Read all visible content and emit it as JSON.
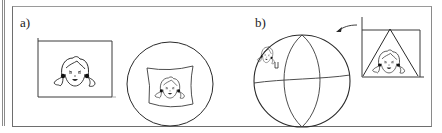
{
  "figure": {
    "panels": [
      {
        "label": "a)",
        "description": "Flat image of a girl's face in a rectangle, and the same image warped onto a circle"
      },
      {
        "label": "b)",
        "description": "Image inside a triangle projected onto a sphere divided by meridians and an equator"
      }
    ],
    "colors": {
      "line": "#2a2a2a",
      "frame": "#6e6e6e",
      "background": "#ffffff"
    }
  }
}
